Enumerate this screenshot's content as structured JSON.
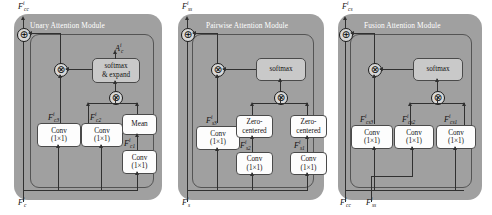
{
  "figure": {
    "background_color": "#ffffff",
    "panel_color": "#a0a0a0",
    "softmax_box_color": "#c9c9c9",
    "op_box_color": "#fdfdfd",
    "line_color": "#303030"
  },
  "panels": [
    {
      "id": "unary",
      "title": "Unary Attention Module",
      "output_label": {
        "base": "F",
        "sup": "i",
        "sub": "cc"
      },
      "input_labels": [
        {
          "base": "F",
          "sup": "i",
          "sub": "c"
        }
      ],
      "attention_label": {
        "base": "A",
        "sup": "i",
        "sub": "c"
      },
      "softmax": {
        "line1": "softmax",
        "line2": "& expand"
      },
      "boxes": [
        {
          "name": "conv-c3",
          "line1": "Conv",
          "line2": "(1×1)",
          "label": {
            "base": "F",
            "sup": "i",
            "sub": "c3"
          }
        },
        {
          "name": "conv-c2",
          "line1": "Conv",
          "line2": "(1×1)",
          "label": {
            "base": "F",
            "sup": "i",
            "sub": "c2"
          }
        },
        {
          "name": "mean",
          "line1": "Mean",
          "line2": ""
        },
        {
          "name": "conv-c1",
          "line1": "Conv",
          "line2": "(1×1)",
          "label": {
            "base": "F",
            "sup": "i",
            "sub": "c1"
          }
        }
      ],
      "operators": [
        "⊕",
        "⊗",
        "⊗"
      ]
    },
    {
      "id": "pairwise",
      "title": "Pairwise Attention Module",
      "output_label": {
        "base": "F",
        "sup": "i",
        "sub": "ss"
      },
      "input_labels": [
        {
          "base": "F",
          "sup": "i",
          "sub": "s"
        }
      ],
      "softmax": {
        "line1": "softmax",
        "line2": ""
      },
      "boxes": [
        {
          "name": "conv-s3",
          "line1": "Conv",
          "line2": "(1×1)",
          "label": {
            "base": "F",
            "sup": "i",
            "sub": "s3"
          }
        },
        {
          "name": "zero-centered-2",
          "line1": "Zero-",
          "line2": "centered"
        },
        {
          "name": "zero-centered-1",
          "line1": "Zero-",
          "line2": "centered"
        },
        {
          "name": "conv-s2",
          "line1": "Conv",
          "line2": "(1×1)",
          "label": {
            "base": "F",
            "sup": "i",
            "sub": "s2"
          }
        },
        {
          "name": "conv-s1",
          "line1": "Conv",
          "line2": "(1×1)",
          "label": {
            "base": "F",
            "sup": "i",
            "sub": "s1"
          }
        }
      ],
      "operators": [
        "⊕",
        "⊗",
        "⊗"
      ]
    },
    {
      "id": "fusion",
      "title": "Fusion Attention Module",
      "output_label": {
        "base": "F",
        "sup": "i",
        "sub": "cs"
      },
      "input_labels": [
        {
          "base": "F",
          "sup": "i",
          "sub": "cc"
        },
        {
          "base": "F",
          "sup": "i",
          "sub": "ss"
        }
      ],
      "softmax": {
        "line1": "softmax",
        "line2": ""
      },
      "boxes": [
        {
          "name": "conv-cs3",
          "line1": "Conv",
          "line2": "(1×1)",
          "label": {
            "base": "F",
            "sup": "i",
            "sub": "cs3"
          }
        },
        {
          "name": "conv-cs2",
          "line1": "Conv",
          "line2": "(1×1)",
          "label": {
            "base": "F",
            "sup": "i",
            "sub": "cs2"
          }
        },
        {
          "name": "conv-cs1",
          "line1": "Conv",
          "line2": "(1×1)",
          "label": {
            "base": "F",
            "sup": "i",
            "sub": "cs1"
          }
        }
      ],
      "operators": [
        "⊕",
        "⊗",
        "⊗"
      ]
    }
  ]
}
